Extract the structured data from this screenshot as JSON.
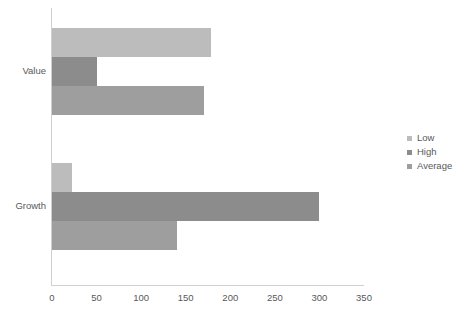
{
  "chart_data": {
    "type": "bar",
    "orientation": "horizontal",
    "title": "",
    "xlabel": "",
    "ylabel": "",
    "categories": [
      "Value",
      "Growth"
    ],
    "series": [
      {
        "name": "Low",
        "color": "#bcbcbc",
        "values": [
          178,
          22
        ]
      },
      {
        "name": "High",
        "color": "#8c8c8c",
        "values": [
          50,
          300
        ]
      },
      {
        "name": "Average",
        "color": "#9e9e9e",
        "values": [
          171,
          140
        ]
      }
    ],
    "xlim": [
      0,
      350
    ],
    "xticks": [
      0,
      50,
      100,
      150,
      200,
      250,
      300,
      350
    ],
    "grid": false,
    "legend_position": "right"
  },
  "axis": {
    "tick_labels": [
      "0",
      "50",
      "100",
      "150",
      "200",
      "250",
      "300",
      "350"
    ],
    "category_labels": [
      "Value",
      "Growth"
    ]
  },
  "legend": {
    "items": [
      {
        "label": "Low"
      },
      {
        "label": "High"
      },
      {
        "label": "Average"
      }
    ]
  },
  "colors": {
    "low": "#bcbcbc",
    "high": "#8c8c8c",
    "average": "#9e9e9e",
    "axis": "#d0d0d0",
    "text": "#58595b",
    "background": "#ffffff"
  }
}
